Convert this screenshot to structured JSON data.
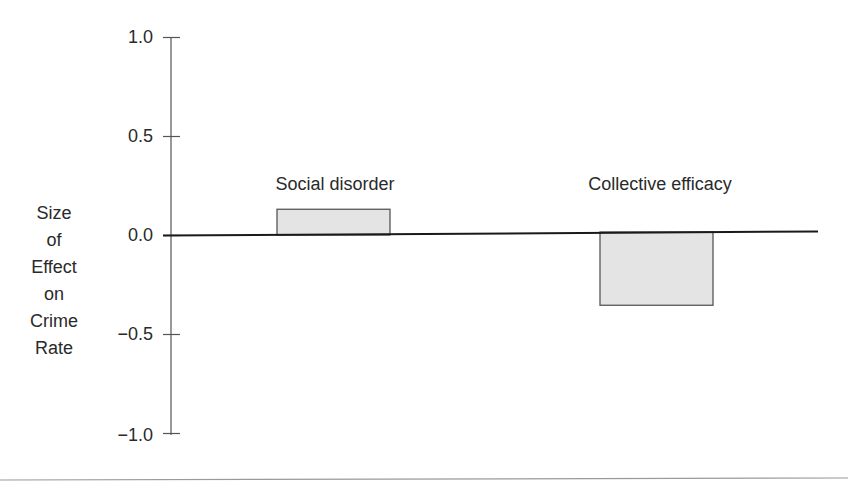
{
  "chart_data": {
    "type": "bar",
    "title": "",
    "xlabel": "",
    "ylabel": "Size of Effect on Crime Rate",
    "ylabel_lines": [
      "Size",
      "of",
      "Effect",
      "on",
      "Crime",
      "Rate"
    ],
    "categories": [
      "Social disorder",
      "Collective efficacy"
    ],
    "values": [
      0.13,
      -0.37
    ],
    "ylim": [
      -1.0,
      1.0
    ],
    "yticks": [
      1.0,
      0.5,
      0.0,
      -0.5,
      -1.0
    ],
    "ytick_labels": [
      "1.0",
      "0.5",
      "0.0",
      "−0.5",
      "−1.0"
    ],
    "grid": false,
    "legend": null,
    "bar_fill": "#e4e4e4",
    "bar_edge": "#555555",
    "axis_color": "#555555",
    "zero_line_color": "#1a1a1a",
    "bottom_rule_color": "#9a9a9a"
  }
}
